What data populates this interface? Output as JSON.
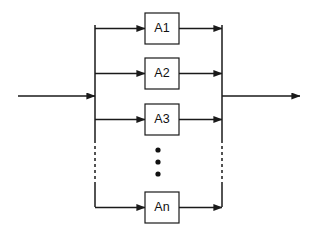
{
  "diagram": {
    "type": "parallel-block-diagram",
    "background_color": "#ffffff",
    "line_color": "#1a1a1a",
    "text_color": "#111111",
    "blocks": [
      {
        "id": "a1",
        "label": "A1",
        "x": 145,
        "y": 13,
        "width": 34,
        "height": 31
      },
      {
        "id": "a2",
        "label": "A2",
        "x": 145,
        "y": 58,
        "width": 34,
        "height": 31
      },
      {
        "id": "a3",
        "label": "A3",
        "x": 145,
        "y": 104,
        "width": 34,
        "height": 31
      },
      {
        "id": "an",
        "label": "An",
        "x": 145,
        "y": 192,
        "width": 34,
        "height": 31
      }
    ],
    "buses": {
      "left_x": 95,
      "right_x": 222,
      "top_y": 25,
      "bottom_y": 207,
      "solid_top_end_y": 140,
      "dashed_start_y": 140,
      "dashed_end_y": 185
    },
    "input": {
      "name": "input-signal",
      "start_x": 18,
      "y": 96,
      "end_x": 95
    },
    "output": {
      "name": "output-signal",
      "start_x": 222,
      "y": 96,
      "end_x": 300
    },
    "ellipsis": {
      "label": "vertical-ellipsis",
      "x": 158,
      "dot_radius": 2.6,
      "dots_y": [
        150,
        162,
        174
      ]
    },
    "branch_rows": [
      {
        "id": "row-a1",
        "y": 25
      },
      {
        "id": "row-a2",
        "y": 73
      },
      {
        "id": "row-a3",
        "y": 120
      },
      {
        "id": "row-an",
        "y": 207
      }
    ]
  }
}
